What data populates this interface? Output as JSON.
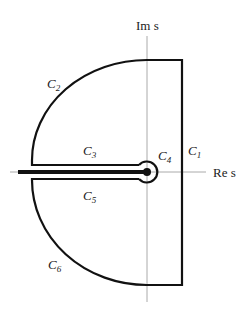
{
  "diagram": {
    "type": "contour-integration-path",
    "axes": {
      "imaginary_label": "Im s",
      "real_label": "Re s"
    },
    "contours": [
      {
        "id": "C1",
        "label": "C",
        "sub": "1",
        "description": "vertical segment right of imaginary axis"
      },
      {
        "id": "C2",
        "label": "C",
        "sub": "2",
        "description": "upper-left circular arc"
      },
      {
        "id": "C3",
        "label": "C",
        "sub": "3",
        "description": "upper edge of branch cut"
      },
      {
        "id": "C4",
        "label": "C",
        "sub": "4",
        "description": "small circle around origin"
      },
      {
        "id": "C5",
        "label": "C",
        "sub": "5",
        "description": "lower edge of branch cut"
      },
      {
        "id": "C6",
        "label": "C",
        "sub": "6",
        "description": "lower-left circular arc"
      }
    ],
    "colors": {
      "contour": "#111111",
      "axis": "#aaaaaa"
    }
  }
}
